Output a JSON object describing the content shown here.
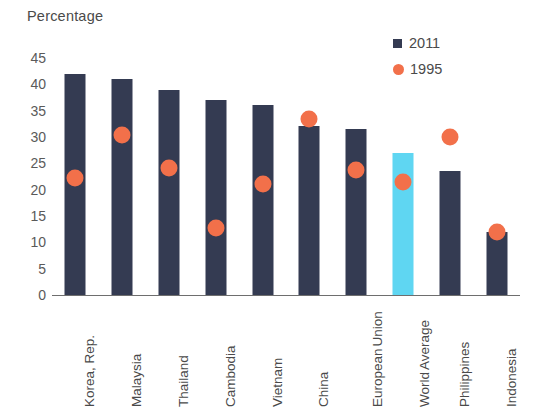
{
  "chart_data": {
    "type": "bar",
    "title": "",
    "ylabel": "Percentage",
    "xlabel": "",
    "ylim": [
      0,
      45
    ],
    "ytick_step": 5,
    "yticks": [
      "45",
      "40",
      "35",
      "30",
      "25",
      "20",
      "15",
      "10",
      "5",
      "0"
    ],
    "grid": false,
    "legend_position": "top-right",
    "categories": [
      "Korea, Rep.",
      "Malaysia",
      "Thailand",
      "Cambodia",
      "Vietnam",
      "China",
      "European Union",
      "World Average",
      "Philippines",
      "Indonesia"
    ],
    "category_lines": [
      [
        "Korea, Rep."
      ],
      [
        "Malaysia"
      ],
      [
        "Thailand"
      ],
      [
        "Cambodia"
      ],
      [
        "Vietnam"
      ],
      [
        "China"
      ],
      [
        "European",
        "Union"
      ],
      [
        "World",
        "Average"
      ],
      [
        "Philippines"
      ],
      [
        "Indonesia"
      ]
    ],
    "series": [
      {
        "name": "2011",
        "type": "bar",
        "color": "#343b52",
        "values": [
          42,
          41,
          39,
          37,
          36,
          32,
          31.5,
          27,
          23.5,
          12
        ]
      },
      {
        "name": "1995",
        "type": "scatter",
        "color": "#f2704a",
        "values": [
          22.2,
          30.4,
          24.1,
          12.7,
          21,
          33.5,
          23.7,
          21.5,
          30,
          12
        ]
      }
    ],
    "highlight": {
      "category": "World Average",
      "index": 7,
      "color": "#5fd6f2"
    }
  },
  "legend": {
    "items": [
      {
        "label": "2011",
        "marker": "square",
        "color": "#343b52"
      },
      {
        "label": "1995",
        "marker": "circle",
        "color": "#f2704a"
      }
    ]
  },
  "colors": {
    "bar_2011": "#343b52",
    "dot_1995": "#f2704a",
    "bar_highlight": "#5fd6f2",
    "axis": "#6e6e6e",
    "text": "#4a4a4a",
    "background": "#ffffff"
  }
}
